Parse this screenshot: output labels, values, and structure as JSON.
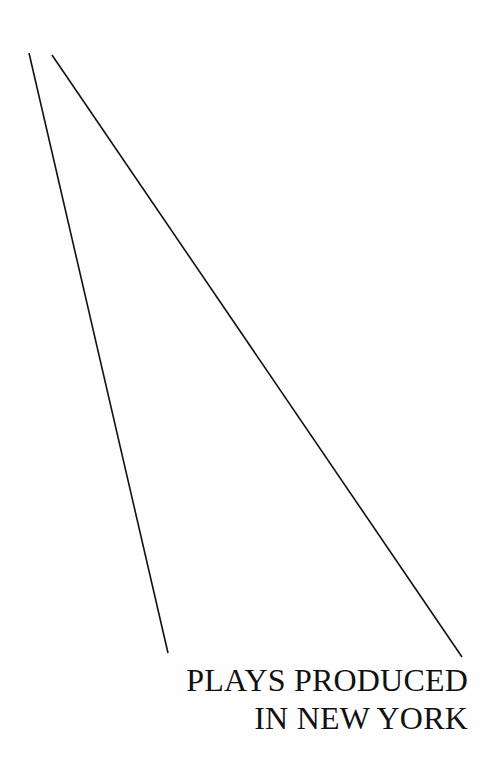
{
  "page": {
    "title_lines": [
      "PLAYS PRODUCED",
      "IN NEW YORK"
    ],
    "line_color": "#111111"
  }
}
